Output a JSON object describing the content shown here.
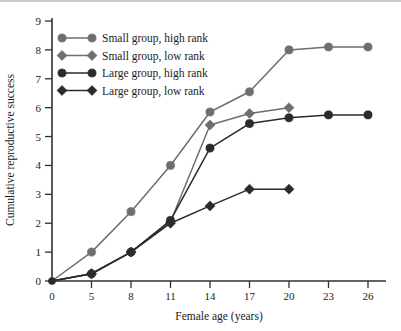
{
  "chart_data": {
    "type": "line",
    "title": "",
    "xlabel": "Female age (years)",
    "ylabel": "Cumulative reproductive success",
    "x": [
      0,
      5,
      8,
      11,
      14,
      17,
      20,
      23,
      26
    ],
    "xtick_labels": [
      "0",
      "5",
      "8",
      "11",
      "14",
      "17",
      "20",
      "23",
      "26"
    ],
    "ytick_labels": [
      "0",
      "1",
      "2",
      "3",
      "4",
      "5",
      "6",
      "7",
      "8",
      "9"
    ],
    "ylim": [
      0,
      9
    ],
    "grid": false,
    "legend_position": "upper-left",
    "series": [
      {
        "name": "Small group, high rank",
        "marker": "circle",
        "color": "#6e6e6e",
        "x": [
          0,
          5,
          8,
          11,
          14,
          17,
          20,
          23,
          26
        ],
        "values": [
          0,
          1.0,
          2.4,
          4.0,
          5.85,
          6.55,
          8.0,
          8.1,
          8.1
        ]
      },
      {
        "name": "Small group, low rank",
        "marker": "diamond",
        "color": "#6e6e6e",
        "x": [
          0,
          5,
          8,
          11,
          14,
          17,
          20
        ],
        "values": [
          0,
          0.25,
          1.0,
          2.05,
          5.4,
          5.8,
          6.0
        ]
      },
      {
        "name": "Large group, high rank",
        "marker": "circle",
        "color": "#2b2b2b",
        "x": [
          0,
          5,
          8,
          11,
          14,
          17,
          20,
          23,
          26
        ],
        "values": [
          0,
          0.25,
          1.0,
          2.1,
          4.6,
          5.45,
          5.65,
          5.75,
          5.75
        ]
      },
      {
        "name": "Large group, low rank",
        "marker": "diamond",
        "color": "#2b2b2b",
        "x": [
          0,
          5,
          8,
          11,
          14,
          17,
          20
        ],
        "values": [
          0,
          0.25,
          1.0,
          2.0,
          2.6,
          3.18,
          3.18
        ]
      }
    ]
  },
  "legend": {
    "items": [
      {
        "label": "Small group, high rank"
      },
      {
        "label": "Small group, low rank"
      },
      {
        "label": "Large group, high rank"
      },
      {
        "label": "Large group, low rank"
      }
    ]
  },
  "colors": {
    "light_series": "#6e6e6e",
    "dark_series": "#2b2b2b",
    "axis": "#303030",
    "text": "#1b1b1b",
    "background": "#ffffff",
    "top_rule": "#c9c9c9"
  }
}
